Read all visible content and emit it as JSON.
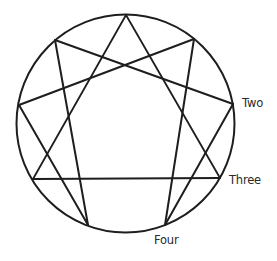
{
  "diagram": {
    "type": "enneagram",
    "circle": {
      "cx": 125.5,
      "cy": 123.5,
      "r": 109,
      "stroke": "#1e1e1e",
      "stroke_width": 2
    },
    "points": [
      {
        "id": "nine",
        "x": 126,
        "y": 15
      },
      {
        "id": "one",
        "x": 194,
        "y": 39
      },
      {
        "id": "two",
        "x": 233,
        "y": 104
      },
      {
        "id": "three",
        "x": 220,
        "y": 178
      },
      {
        "id": "four",
        "x": 165,
        "y": 225
      },
      {
        "id": "five",
        "x": 88,
        "y": 225
      },
      {
        "id": "six",
        "x": 33,
        "y": 179
      },
      {
        "id": "seven",
        "x": 19,
        "y": 105
      },
      {
        "id": "eight",
        "x": 55,
        "y": 40
      }
    ],
    "triangle": [
      "nine",
      "three",
      "six"
    ],
    "hexad": [
      "one",
      "four",
      "two",
      "eight",
      "five",
      "seven"
    ],
    "line_color": "#1e1e1e",
    "labels": [
      {
        "id": "label-two",
        "text": "Two",
        "x": 242,
        "y": 98
      },
      {
        "id": "label-three",
        "text": "Three",
        "x": 229,
        "y": 175
      },
      {
        "id": "label-four",
        "text": "Four",
        "x": 154,
        "y": 235
      }
    ]
  }
}
